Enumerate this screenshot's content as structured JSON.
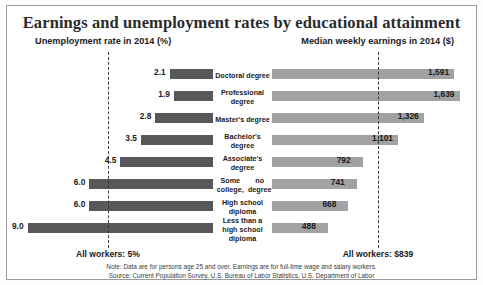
{
  "header": {
    "title": "Earnings and unemployment rates by educational attainment",
    "subtitle_left": "Unemployment rate in 2014 (%)",
    "subtitle_right": "Median weekly earnings in 2014 ($)"
  },
  "reference": {
    "left_label": "All workers: 5%",
    "right_label": "All workers: $839",
    "left_value": 5,
    "right_value": 839
  },
  "footer": {
    "note": "Note: Data are for persons age 25 and over. Earnings are for full-time wage and salary workers.",
    "source": "Source: Current Population Survey, U.S. Bureau of Labor Statistics, U.S. Department of Labor"
  },
  "colors": {
    "unemployment_bar": "#58585a",
    "earnings_bar": "#a2a2a4",
    "reference_line": "#3a3a3a",
    "text": "#1b1b1b"
  },
  "chart_data": {
    "type": "bar",
    "title": "Earnings and unemployment rates by educational attainment",
    "categories": [
      "Doctoral degree",
      "Professional degree",
      "Master's degree",
      "Bachelor's degree",
      "Associate's degree",
      "Some college, no degree",
      "High school diploma",
      "Less than a high school diploma"
    ],
    "series": [
      {
        "name": "Unemployment rate in 2014 (%)",
        "values": [
          2.1,
          1.9,
          2.8,
          3.5,
          4.5,
          6.0,
          6.0,
          9.0
        ],
        "labels": [
          "2.1",
          "1.9",
          "2.8",
          "3.5",
          "4.5",
          "6.0",
          "6.0",
          "9.0"
        ],
        "direction": "left",
        "xlim": [
          0,
          10
        ],
        "reference": 5
      },
      {
        "name": "Median weekly earnings in 2014 ($)",
        "values": [
          1591,
          1639,
          1326,
          1101,
          792,
          741,
          668,
          488
        ],
        "labels": [
          "1,591",
          "1,639",
          "1,326",
          "1,101",
          "792",
          "741",
          "668",
          "488"
        ],
        "direction": "right",
        "xlim": [
          0,
          1800
        ],
        "reference": 839
      }
    ],
    "xlabel": "",
    "ylabel": "",
    "grid": false,
    "legend": "none"
  },
  "rows": [
    {
      "label": "Doctoral degree",
      "rate": "2.1",
      "earn": "1,591"
    },
    {
      "label": "Professional degree",
      "rate": "1.9",
      "earn": "1,639"
    },
    {
      "label": "Master's degree",
      "rate": "2.8",
      "earn": "1,326"
    },
    {
      "label": "Bachelor's degree",
      "rate": "3.5",
      "earn": "1,101"
    },
    {
      "label": "Associate's degree",
      "rate": "4.5",
      "earn": "792"
    },
    {
      "label": "Some college,\nno degree",
      "rate": "6.0",
      "earn": "741"
    },
    {
      "label": "High school diploma",
      "rate": "6.0",
      "earn": "668"
    },
    {
      "label": "Less than a\nhigh school diploma",
      "rate": "9.0",
      "earn": "488"
    }
  ]
}
